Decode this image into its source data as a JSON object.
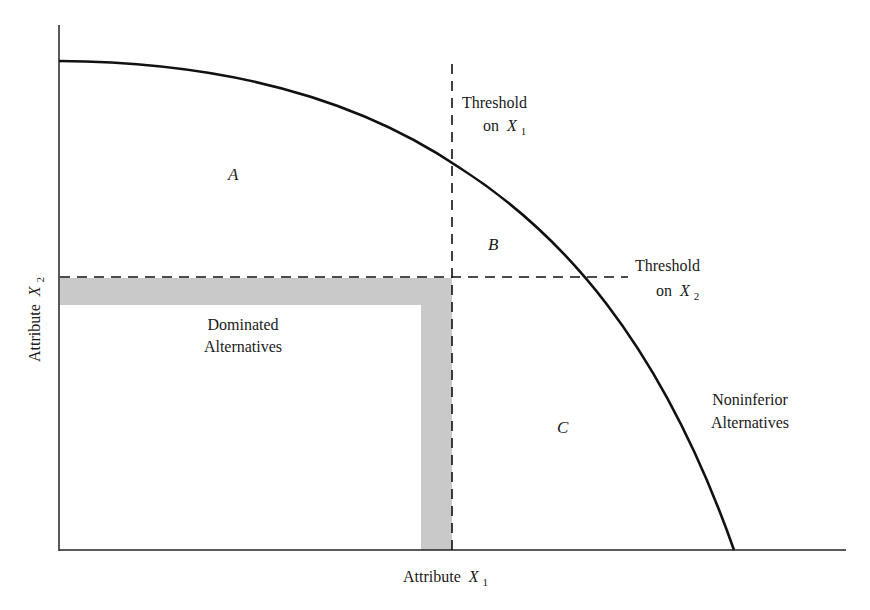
{
  "diagram": {
    "type": "tradeoff-curve",
    "axes": {
      "x_label": "Attribute",
      "x_var": "X",
      "x_sub": "1",
      "y_label": "Attribute",
      "y_var": "X",
      "y_sub": "2"
    },
    "regions": {
      "a": "A",
      "b": "B",
      "c": "C"
    },
    "annotations": {
      "threshold_x1_line1": "Threshold",
      "threshold_x1_line2": "on",
      "threshold_x1_var": "X",
      "threshold_x1_sub": "1",
      "threshold_x2_line1": "Threshold",
      "threshold_x2_line2": "on",
      "threshold_x2_var": "X",
      "threshold_x2_sub": "2",
      "dominated_line1": "Dominated",
      "dominated_line2": "Alternatives",
      "noninferior_line1": "Noninferior",
      "noninferior_line2": "Alternatives"
    },
    "colors": {
      "ink": "#111111",
      "shade": "#c8c8c8",
      "background": "#ffffff"
    }
  }
}
